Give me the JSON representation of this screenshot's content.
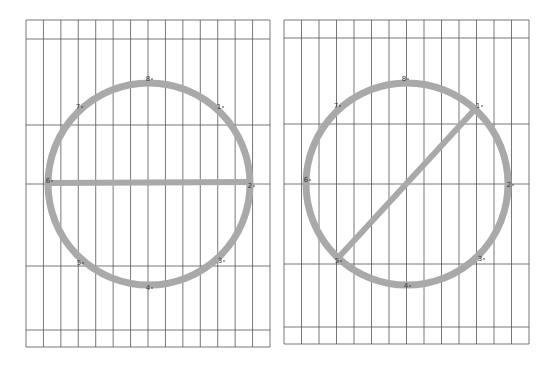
{
  "colors": {
    "grid": "#555555",
    "circle": "#a9a9a9",
    "chord": "#a9a9a9",
    "label": "#333333",
    "background": "#ffffff"
  },
  "panels": [
    {
      "name": "left-panel",
      "grid": {
        "x0": 26,
        "x1": 270,
        "columns": 14,
        "rows_y": [
          20,
          39,
          125,
          184,
          266,
          330,
          347
        ]
      },
      "circle": {
        "cx": 149,
        "cy": 184,
        "r": 101
      },
      "chord": {
        "from_label": "6",
        "to_label": "2",
        "x1": 48,
        "y1": 183,
        "x2": 250,
        "y2": 182
      },
      "points": [
        {
          "label": "8",
          "x": 148,
          "y": 79
        },
        {
          "label": "1",
          "x": 219,
          "y": 107
        },
        {
          "label": "2",
          "x": 250,
          "y": 186
        },
        {
          "label": "3",
          "x": 220,
          "y": 261
        },
        {
          "label": "4",
          "x": 148,
          "y": 288
        },
        {
          "label": "5",
          "x": 79,
          "y": 263
        },
        {
          "label": "6",
          "x": 48,
          "y": 181
        },
        {
          "label": "7",
          "x": 78,
          "y": 107
        }
      ]
    },
    {
      "name": "right-panel",
      "grid": {
        "x0": 284,
        "x1": 529,
        "columns": 14,
        "rows_y": [
          20,
          38,
          124,
          184,
          264,
          327,
          344
        ]
      },
      "circle": {
        "cx": 407,
        "cy": 184,
        "r": 101
      },
      "chord": {
        "from_label": "1",
        "to_label": "5",
        "x1": 477,
        "y1": 107,
        "x2": 338,
        "y2": 258
      },
      "points": [
        {
          "label": "8",
          "x": 404,
          "y": 79
        },
        {
          "label": "1",
          "x": 478,
          "y": 106
        },
        {
          "label": "2",
          "x": 509,
          "y": 185
        },
        {
          "label": "3",
          "x": 480,
          "y": 259
        },
        {
          "label": "4",
          "x": 406,
          "y": 286
        },
        {
          "label": "5",
          "x": 337,
          "y": 261
        },
        {
          "label": "6",
          "x": 306,
          "y": 180
        },
        {
          "label": "7",
          "x": 336,
          "y": 106
        }
      ]
    }
  ]
}
